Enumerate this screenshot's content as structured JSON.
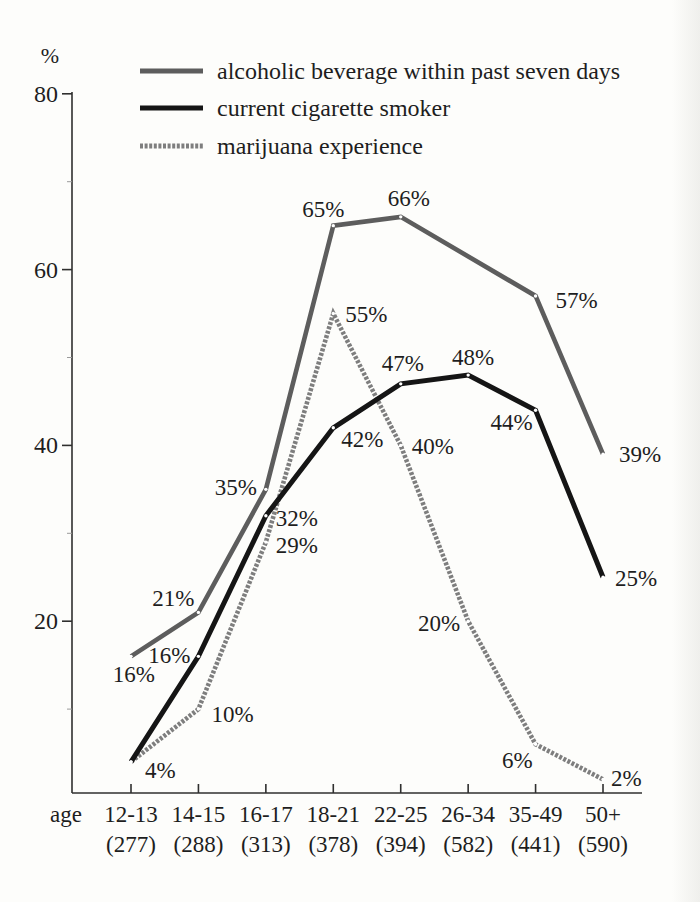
{
  "chart_data": {
    "type": "line",
    "title": "",
    "unit_label": "%",
    "x_axis_label": "age",
    "ylim": [
      0,
      80
    ],
    "grid": false,
    "legend_position": "top-left-inside",
    "y_ticks": [
      80,
      60,
      40,
      20
    ],
    "y_minor_ticks": [
      70,
      50,
      30,
      10
    ],
    "categories": [
      "12-13",
      "14-15",
      "16-17",
      "18-21",
      "22-25",
      "26-34",
      "35-49",
      "50+"
    ],
    "category_counts": [
      "(277)",
      "(288)",
      "(313)",
      "(378)",
      "(394)",
      "(582)",
      "(441)",
      "(590)"
    ],
    "point_marker": {
      "shape": "dot",
      "color": "#ffffff",
      "radius": 1.7
    },
    "series": [
      {
        "key": "alcohol",
        "name": "alcoholic beverage within past seven days",
        "color": "#5d5d5d",
        "style": "solid",
        "width": 4.6,
        "values": [
          16,
          21,
          35,
          65,
          66,
          null,
          57,
          39
        ],
        "labels": [
          {
            "text": "16%",
            "anchor": "end",
            "dx": 24,
            "dy": 26
          },
          {
            "text": "21%",
            "anchor": "end",
            "dx": -4,
            "dy": -6
          },
          {
            "text": "35%",
            "anchor": "end",
            "dx": -9,
            "dy": 6
          },
          {
            "text": "65%",
            "anchor": "middle",
            "dx": -10,
            "dy": -9
          },
          {
            "text": "66%",
            "anchor": "middle",
            "dx": 8,
            "dy": -11
          },
          null,
          {
            "text": "57%",
            "anchor": "start",
            "dx": 20,
            "dy": 12
          },
          {
            "text": "39%",
            "anchor": "start",
            "dx": 16,
            "dy": 8
          }
        ]
      },
      {
        "key": "cigarette",
        "name": "current cigarette smoker",
        "color": "#151515",
        "style": "solid",
        "width": 5,
        "values": [
          4,
          16,
          32,
          42,
          47,
          48,
          44,
          25
        ],
        "labels": [
          {
            "text": "4%",
            "anchor": "start",
            "dx": 14,
            "dy": 16
          },
          {
            "text": "16%",
            "anchor": "end",
            "dx": -8,
            "dy": 7
          },
          {
            "text": "32%",
            "anchor": "start",
            "dx": 10,
            "dy": 10
          },
          {
            "text": "42%",
            "anchor": "start",
            "dx": 8,
            "dy": 19
          },
          {
            "text": "47%",
            "anchor": "middle",
            "dx": 2,
            "dy": -13
          },
          {
            "text": "48%",
            "anchor": "middle",
            "dx": 5,
            "dy": -10
          },
          {
            "text": "44%",
            "anchor": "end",
            "dx": -3,
            "dy": 20
          },
          {
            "text": "25%",
            "anchor": "start",
            "dx": 12,
            "dy": 9
          }
        ]
      },
      {
        "key": "marijuana",
        "name": "marijuana experience",
        "color": "#7e7e7e",
        "style": "textured",
        "width": 4.6,
        "values": [
          4,
          10,
          29,
          55,
          40,
          20,
          6,
          2
        ],
        "labels": [
          null,
          {
            "text": "10%",
            "anchor": "start",
            "dx": 13,
            "dy": 13
          },
          {
            "text": "29%",
            "anchor": "start",
            "dx": 10,
            "dy": 11
          },
          {
            "text": "55%",
            "anchor": "start",
            "dx": 12,
            "dy": 8
          },
          {
            "text": "40%",
            "anchor": "start",
            "dx": 11,
            "dy": 9
          },
          {
            "text": "20%",
            "anchor": "end",
            "dx": -8,
            "dy": 10
          },
          {
            "text": "6%",
            "anchor": "end",
            "dx": -3,
            "dy": 24
          },
          {
            "text": "2%",
            "anchor": "start",
            "dx": 8,
            "dy": 7
          }
        ]
      }
    ]
  }
}
